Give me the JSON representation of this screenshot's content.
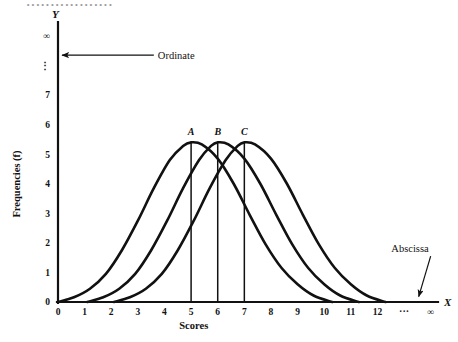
{
  "figure": {
    "background_color": "#ffffff",
    "ink_color": "#111111",
    "cropped_caption_fragment": "··················"
  },
  "chart_data": {
    "type": "line",
    "title": "",
    "subtitle": "",
    "xlabel": "Scores",
    "ylabel": "Frequencies (f)",
    "x_axis_name": "X",
    "y_axis_name": "Y",
    "xlim": [
      0,
      14.2
    ],
    "ylim": [
      0,
      9.2
    ],
    "grid": false,
    "legend": "none",
    "x_ticks": [
      {
        "value": 0,
        "label": "0"
      },
      {
        "value": 1,
        "label": "1"
      },
      {
        "value": 2,
        "label": "2"
      },
      {
        "value": 3,
        "label": "3"
      },
      {
        "value": 4,
        "label": "4"
      },
      {
        "value": 5,
        "label": "5"
      },
      {
        "value": 6,
        "label": "6"
      },
      {
        "value": 7,
        "label": "7"
      },
      {
        "value": 8,
        "label": "8"
      },
      {
        "value": 9,
        "label": "9"
      },
      {
        "value": 10,
        "label": "10"
      },
      {
        "value": 11,
        "label": "11"
      },
      {
        "value": 12,
        "label": "12"
      },
      {
        "value": 13,
        "label": "···"
      },
      {
        "value": 14,
        "label": "∞"
      }
    ],
    "y_ticks": [
      {
        "value": 0,
        "label": "0"
      },
      {
        "value": 1,
        "label": "1"
      },
      {
        "value": 2,
        "label": "2"
      },
      {
        "value": 3,
        "label": "3"
      },
      {
        "value": 4,
        "label": "4"
      },
      {
        "value": 5,
        "label": "5"
      },
      {
        "value": 6,
        "label": "6"
      },
      {
        "value": 7,
        "label": "7"
      },
      {
        "value": 8,
        "label": "⋮"
      },
      {
        "value": 9,
        "label": "∞"
      }
    ],
    "series": [
      {
        "name": "A",
        "label": "A",
        "peak_x": 5,
        "peak_y": 5.4,
        "start_x": 0,
        "end_x": 10.3,
        "points": [
          {
            "x": 0.0,
            "y": 0.0
          },
          {
            "x": 0.6,
            "y": 0.16
          },
          {
            "x": 1.2,
            "y": 0.45
          },
          {
            "x": 1.8,
            "y": 0.95
          },
          {
            "x": 2.4,
            "y": 1.75
          },
          {
            "x": 3.0,
            "y": 2.75
          },
          {
            "x": 3.6,
            "y": 3.85
          },
          {
            "x": 4.2,
            "y": 4.8
          },
          {
            "x": 4.7,
            "y": 5.28
          },
          {
            "x": 5.0,
            "y": 5.4
          },
          {
            "x": 5.4,
            "y": 5.33
          },
          {
            "x": 6.0,
            "y": 4.85
          },
          {
            "x": 6.6,
            "y": 4.0
          },
          {
            "x": 7.2,
            "y": 2.95
          },
          {
            "x": 7.8,
            "y": 1.95
          },
          {
            "x": 8.4,
            "y": 1.15
          },
          {
            "x": 9.0,
            "y": 0.6
          },
          {
            "x": 9.6,
            "y": 0.22
          },
          {
            "x": 10.3,
            "y": 0.0
          }
        ]
      },
      {
        "name": "B",
        "label": "B",
        "peak_x": 6,
        "peak_y": 5.4,
        "start_x": 1.1,
        "end_x": 11.3,
        "points": [
          {
            "x": 1.1,
            "y": 0.0
          },
          {
            "x": 1.7,
            "y": 0.16
          },
          {
            "x": 2.3,
            "y": 0.45
          },
          {
            "x": 2.9,
            "y": 0.95
          },
          {
            "x": 3.5,
            "y": 1.75
          },
          {
            "x": 4.1,
            "y": 2.75
          },
          {
            "x": 4.7,
            "y": 3.85
          },
          {
            "x": 5.3,
            "y": 4.8
          },
          {
            "x": 5.75,
            "y": 5.28
          },
          {
            "x": 6.0,
            "y": 5.4
          },
          {
            "x": 6.4,
            "y": 5.33
          },
          {
            "x": 7.0,
            "y": 4.85
          },
          {
            "x": 7.6,
            "y": 4.0
          },
          {
            "x": 8.2,
            "y": 2.95
          },
          {
            "x": 8.8,
            "y": 1.95
          },
          {
            "x": 9.4,
            "y": 1.15
          },
          {
            "x": 10.0,
            "y": 0.6
          },
          {
            "x": 10.6,
            "y": 0.22
          },
          {
            "x": 11.3,
            "y": 0.0
          }
        ]
      },
      {
        "name": "C",
        "label": "C",
        "peak_x": 7,
        "peak_y": 5.4,
        "start_x": 2.1,
        "end_x": 12.3,
        "points": [
          {
            "x": 2.1,
            "y": 0.0
          },
          {
            "x": 2.7,
            "y": 0.16
          },
          {
            "x": 3.3,
            "y": 0.45
          },
          {
            "x": 3.9,
            "y": 0.95
          },
          {
            "x": 4.5,
            "y": 1.75
          },
          {
            "x": 5.1,
            "y": 2.75
          },
          {
            "x": 5.7,
            "y": 3.85
          },
          {
            "x": 6.3,
            "y": 4.8
          },
          {
            "x": 6.75,
            "y": 5.28
          },
          {
            "x": 7.0,
            "y": 5.4
          },
          {
            "x": 7.4,
            "y": 5.33
          },
          {
            "x": 8.0,
            "y": 4.85
          },
          {
            "x": 8.6,
            "y": 4.0
          },
          {
            "x": 9.2,
            "y": 2.95
          },
          {
            "x": 9.8,
            "y": 1.95
          },
          {
            "x": 10.4,
            "y": 1.15
          },
          {
            "x": 11.0,
            "y": 0.6
          },
          {
            "x": 11.6,
            "y": 0.22
          },
          {
            "x": 12.3,
            "y": 0.0
          }
        ]
      }
    ],
    "annotations": [
      {
        "name": "ordinate",
        "text": "Ordinate",
        "arrow_from_x": 3.6,
        "arrow_from_y": 8.35,
        "arrow_to_x": 0.15,
        "arrow_to_y": 8.35,
        "text_anchor": "start"
      },
      {
        "name": "abscissa",
        "text": "Abscissa",
        "arrow_from_x": 14.0,
        "arrow_from_y": 1.55,
        "arrow_to_x": 13.55,
        "arrow_to_y": 0.18,
        "text_anchor": "end"
      }
    ]
  }
}
